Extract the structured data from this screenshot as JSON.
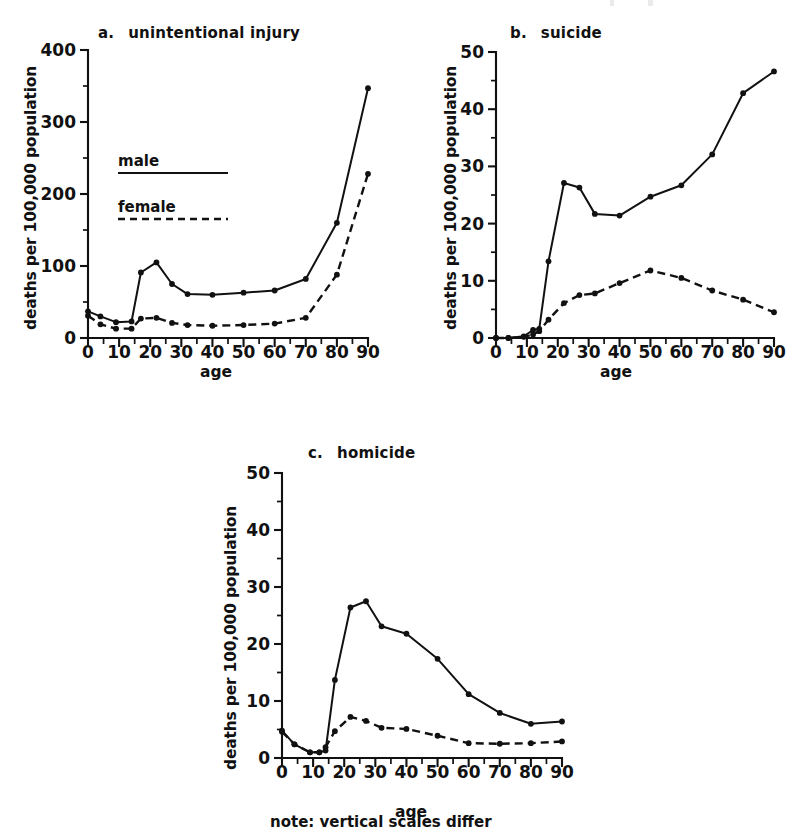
{
  "figure": {
    "note": "note: vertical scales differ",
    "legend": {
      "male_label": "male",
      "female_label": "female"
    },
    "common": {
      "ylabel": "deaths per 100,000 population",
      "xlabel": "age"
    }
  },
  "chart_data": [
    {
      "type": "line",
      "panel": "a",
      "panel_letter": "a.",
      "title": "unintentional injury",
      "xlabel": "age",
      "ylabel": "deaths per 100,000 population",
      "xlim": [
        0,
        90
      ],
      "ylim": [
        0,
        400
      ],
      "xticks": [
        0,
        10,
        20,
        30,
        40,
        50,
        60,
        70,
        80,
        90
      ],
      "xtick_labels": [
        "0",
        "10",
        "20",
        "30",
        "40",
        "50",
        "60",
        "70",
        "80",
        "90"
      ],
      "xminor_step": 5,
      "yticks": [
        0,
        100,
        200,
        300,
        400
      ],
      "ytick_labels": [
        "0",
        "100",
        "200",
        "300",
        "400"
      ],
      "yminor_step": 50,
      "grid": false,
      "legend_position": "inside-upper-left",
      "x": [
        0,
        4,
        9,
        14,
        17,
        22,
        27,
        32,
        40,
        50,
        60,
        70,
        80,
        90
      ],
      "series": [
        {
          "name": "male",
          "style": "solid",
          "values": [
            37,
            30,
            22,
            23,
            91,
            105,
            75,
            61,
            60,
            63,
            66,
            82,
            160,
            347
          ]
        },
        {
          "name": "female",
          "style": "dashed",
          "values": [
            31,
            19,
            13,
            13,
            27,
            28,
            21,
            18,
            17,
            18,
            20,
            28,
            88,
            228
          ]
        }
      ]
    },
    {
      "type": "line",
      "panel": "b",
      "panel_letter": "b.",
      "title": "suicide",
      "xlabel": "age",
      "ylabel": "deaths per 100,000 population",
      "xlim": [
        0,
        90
      ],
      "ylim": [
        0,
        50
      ],
      "xticks": [
        0,
        10,
        20,
        30,
        40,
        50,
        60,
        70,
        80,
        90
      ],
      "xtick_labels": [
        "0",
        "10",
        "20",
        "30",
        "40",
        "50",
        "60",
        "70",
        "80",
        "90"
      ],
      "xminor_step": 5,
      "yticks": [
        0,
        10,
        20,
        30,
        40,
        50
      ],
      "ytick_labels": [
        "0",
        "10",
        "20",
        "30",
        "40",
        "50"
      ],
      "yminor_step": 5,
      "grid": false,
      "legend_position": "none",
      "x": [
        0,
        4,
        9,
        12,
        14,
        17,
        22,
        27,
        32,
        40,
        50,
        60,
        70,
        80,
        90
      ],
      "series": [
        {
          "name": "male",
          "style": "solid",
          "values": [
            0,
            0,
            0.3,
            1.4,
            1.6,
            13.4,
            27.1,
            26.3,
            21.7,
            21.4,
            24.7,
            26.7,
            32.1,
            42.8,
            46.6
          ]
        },
        {
          "name": "female",
          "style": "dashed",
          "values": [
            0,
            0,
            0.2,
            0.6,
            1.2,
            3.2,
            6.1,
            7.5,
            7.8,
            9.6,
            11.8,
            10.5,
            8.3,
            6.7,
            4.5
          ]
        }
      ]
    },
    {
      "type": "line",
      "panel": "c",
      "panel_letter": "c.",
      "title": "homicide",
      "xlabel": "age",
      "ylabel": "deaths per 100,000 population",
      "xlim": [
        0,
        90
      ],
      "ylim": [
        0,
        50
      ],
      "xticks": [
        0,
        10,
        20,
        30,
        40,
        50,
        60,
        70,
        80,
        90
      ],
      "xtick_labels": [
        "0",
        "10",
        "20",
        "30",
        "40",
        "50",
        "60",
        "70",
        "80",
        "90"
      ],
      "xminor_step": 5,
      "yticks": [
        0,
        10,
        20,
        30,
        40,
        50
      ],
      "ytick_labels": [
        "0",
        "10",
        "20",
        "30",
        "40",
        "50"
      ],
      "yminor_step": 5,
      "grid": false,
      "legend_position": "none",
      "x": [
        0,
        4,
        9,
        12,
        14,
        17,
        22,
        27,
        32,
        40,
        50,
        60,
        70,
        80,
        90
      ],
      "series": [
        {
          "name": "male",
          "style": "solid",
          "values": [
            4.8,
            2.4,
            1.0,
            1.0,
            1.3,
            13.7,
            26.4,
            27.5,
            23.1,
            21.8,
            17.4,
            11.2,
            7.9,
            6.0,
            6.4
          ]
        },
        {
          "name": "female",
          "style": "dashed",
          "values": [
            4.6,
            2.4,
            1.0,
            1.0,
            1.9,
            4.7,
            7.2,
            6.5,
            5.3,
            5.1,
            3.9,
            2.6,
            2.5,
            2.6,
            2.9
          ]
        }
      ]
    }
  ]
}
